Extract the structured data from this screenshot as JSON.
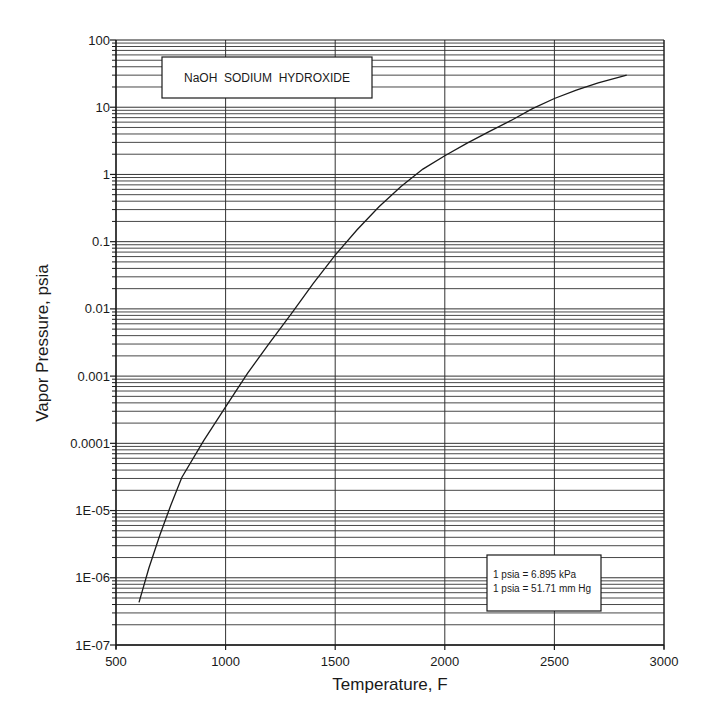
{
  "chart_data": {
    "type": "line",
    "title": "NaOH  SODIUM  HYDROXIDE",
    "xlabel": "Temperature, F",
    "ylabel": "Vapor Pressure, psia",
    "xlim": [
      500,
      3000
    ],
    "ylim": [
      1e-07,
      100
    ],
    "yscale": "log",
    "xscale": "linear",
    "grid": true,
    "x_ticks": [
      500,
      1000,
      1500,
      2000,
      2500,
      3000
    ],
    "x_tick_labels": [
      "500",
      "1000",
      "1500",
      "2000",
      "2500",
      "3000"
    ],
    "y_ticks": [
      1e-07,
      1e-06,
      1e-05,
      0.0001,
      0.001,
      0.01,
      0.1,
      1,
      10,
      100
    ],
    "y_tick_labels": [
      "1E-07",
      "1E-06",
      "1E-05",
      "0.0001",
      "0.001",
      "0.01",
      "0.1",
      "1",
      "10",
      "100"
    ],
    "series": [
      {
        "name": "NaOH vapor pressure",
        "x": [
          605,
          650,
          700,
          750,
          800,
          900,
          1000,
          1100,
          1200,
          1300,
          1400,
          1500,
          1600,
          1700,
          1800,
          1900,
          2000,
          2100,
          2200,
          2300,
          2400,
          2500,
          2600,
          2700,
          2830
        ],
        "y": [
          4.3e-07,
          1.4e-06,
          4.3e-06,
          1.2e-05,
          3.1e-05,
          0.00011,
          0.00035,
          0.0011,
          0.0031,
          0.0085,
          0.024,
          0.063,
          0.15,
          0.33,
          0.66,
          1.2,
          1.9,
          2.9,
          4.3,
          6.3,
          9.5,
          13.5,
          18,
          23,
          30
        ]
      }
    ],
    "annotations": [
      {
        "text": "1 psia = 6.895 kPa"
      },
      {
        "text": "1 psia = 51.71 mm Hg"
      }
    ]
  },
  "title_box": {
    "label": "NaOH  SODIUM  HYDROXIDE"
  },
  "note_box": {
    "line1": "1 psia = 6.895 kPa",
    "line2": "1 psia = 51.71 mm Hg"
  },
  "axes": {
    "xlabel": "Temperature, F",
    "ylabel": "Vapor Pressure, psia"
  },
  "colors": {
    "ink": "#1a1a1a",
    "grid": "#333333",
    "background": "#ffffff"
  }
}
